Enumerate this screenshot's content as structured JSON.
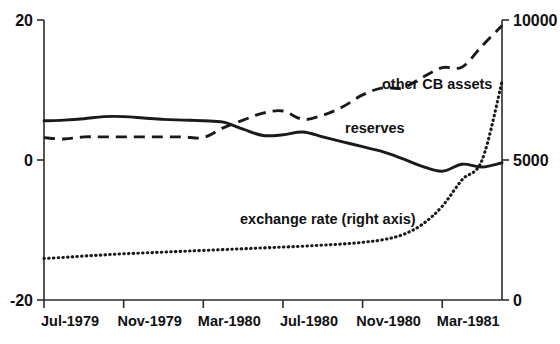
{
  "chart_data": {
    "type": "line",
    "title": "",
    "xlabel": "",
    "ylabel": "",
    "grid": false,
    "legend_position": "inline-annotations",
    "x": [
      "Jul-1979",
      "Aug-1979",
      "Sep-1979",
      "Oct-1979",
      "Nov-1979",
      "Dec-1979",
      "Jan-1980",
      "Feb-1980",
      "Mar-1980",
      "Apr-1980",
      "May-1980",
      "Jun-1980",
      "Jul-1980",
      "Aug-1980",
      "Sep-1980",
      "Oct-1980",
      "Nov-1980",
      "Dec-1980",
      "Jan-1981",
      "Feb-1981",
      "Mar-1981",
      "Apr-1981",
      "May-1981",
      "Jun-1981"
    ],
    "x_tick_labels": [
      "Jul-1979",
      "Nov-1979",
      "Mar-1980",
      "Jul-1980",
      "Nov-1980",
      "Mar-1981"
    ],
    "left_axis": {
      "label": "",
      "ylim": [
        -20,
        20
      ],
      "ticks": [
        -20,
        0,
        20
      ],
      "tick_labels": [
        "-20",
        "0",
        "20"
      ]
    },
    "right_axis": {
      "label": "",
      "ylim": [
        0,
        10000
      ],
      "ticks": [
        0,
        5000,
        10000
      ],
      "tick_labels": [
        "0",
        "5000",
        "10000"
      ]
    },
    "series": [
      {
        "name": "reserves",
        "style": "solid",
        "axis": "left",
        "annotation": "reserves",
        "values": [
          5.6,
          5.7,
          5.9,
          6.2,
          6.2,
          6.0,
          5.8,
          5.7,
          5.6,
          5.4,
          4.4,
          3.5,
          3.6,
          4.0,
          3.3,
          2.6,
          1.9,
          1.2,
          0.2,
          -0.9,
          -1.6,
          -0.6,
          -1.0,
          -0.4
        ]
      },
      {
        "name": "other CB assets",
        "style": "dashed",
        "axis": "left",
        "annotation": "other CB assets",
        "values": [
          3.2,
          3.0,
          3.3,
          3.3,
          3.3,
          3.3,
          3.3,
          3.3,
          3.2,
          4.6,
          5.7,
          6.7,
          7.0,
          5.8,
          6.4,
          7.6,
          9.3,
          10.3,
          10.3,
          11.8,
          13.2,
          13.3,
          16.3,
          19.2
        ]
      },
      {
        "name": "exchange rate (right axis)",
        "style": "dotted",
        "axis": "right",
        "annotation": "exchange rate (right axis)",
        "values": [
          1480,
          1520,
          1570,
          1610,
          1650,
          1680,
          1710,
          1740,
          1770,
          1800,
          1830,
          1860,
          1890,
          1920,
          1960,
          2000,
          2060,
          2150,
          2330,
          2700,
          3350,
          4300,
          5000,
          7800
        ]
      }
    ],
    "annotations": [
      {
        "text": "other CB assets",
        "x_px": 382,
        "y_px": 89
      },
      {
        "text": "reserves",
        "x_px": 345,
        "y_px": 133
      },
      {
        "text": "exchange rate (right axis)",
        "x_px": 240,
        "y_px": 224
      }
    ]
  }
}
